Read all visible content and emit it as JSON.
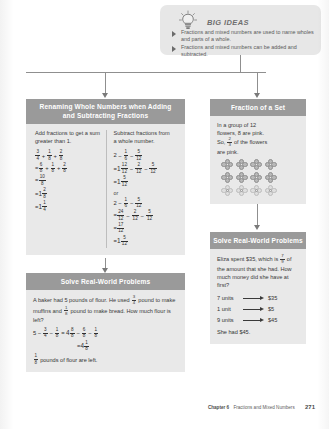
{
  "big_ideas": {
    "title": "BIG IDEAS",
    "icon": "lightbulb-icon",
    "bullets": [
      "Fractions and mixed numbers are used to name wholes and parts of a whole.",
      "Fractions and mixed numbers can be added and subtracted."
    ]
  },
  "panels": {
    "renaming": {
      "heading_line1": "Renaming Whole Numbers when Adding",
      "heading_line2": "and Subtracting Fractions",
      "left": {
        "lead": "Add fractions to get a sum greater than 1.",
        "steps": [
          "3/4 + 1/8 + 2/8",
          "= 6/8 + 1/8 + 2/8",
          "= 10/8",
          "= 1 2/8",
          "= 1 1/4"
        ]
      },
      "right": {
        "lead": "Subtract fractions from a whole number.",
        "steps_a": [
          "2 − 1/6 − 5/12",
          "= 1 12/12 − 2/12 − 5/12",
          "= 1 5/12"
        ],
        "or_label": "or",
        "steps_b": [
          "2 − 1/6 − 5/12",
          "= 24/12 − 2/12 − 5/12",
          "= 17/12",
          "= 1 5/12"
        ]
      }
    },
    "solve_left": {
      "heading": "Solve Real-World Problems",
      "problem_line1": "A baker had 5 pounds of flour. He used",
      "problem_frac1": "3/4",
      "problem_line1b": "pound",
      "problem_line2a": "to make muffins and",
      "problem_frac2": "1/8",
      "problem_line2b": "pound to make bread.",
      "problem_line3": "How much flour is left?",
      "work_line1": "5 − 3/4 − 1/8 = 4 8/8 − 6/8 − 1/8",
      "work_line2": "= 4 1/8",
      "answer_frac": "4 1/8",
      "answer_text": "pounds of flour are left."
    },
    "fraction_of_set": {
      "heading": "Fraction of a Set",
      "line1": "In a group of 12",
      "line2": "flowers, 8 are pink.",
      "line3a": "So,",
      "line3_frac": "2/3",
      "line3b": "of the flowers",
      "line4": "are pink.",
      "flower_rows": [
        {
          "count": 4,
          "shade": "pink"
        },
        {
          "count": 4,
          "shade": "pink"
        },
        {
          "count": 4,
          "shade": "light"
        }
      ]
    },
    "solve_right": {
      "heading": "Solve Real-World Problems",
      "problem_line1a": "Eliza spent $35, which is",
      "problem_frac": "7/9",
      "problem_line1b": "of",
      "problem_line2": "the amount that she had. How",
      "problem_line3": "much money did she have at first?",
      "units": [
        {
          "label": "7 units",
          "value": "$35"
        },
        {
          "label": "1 unit",
          "value": "$5"
        },
        {
          "label": "9 units",
          "value": "$45"
        }
      ],
      "answer": "She had $45."
    }
  },
  "footer": {
    "chapter": "Chapter 6",
    "title": "Fractions and Mixed Numbers",
    "page": "271"
  }
}
